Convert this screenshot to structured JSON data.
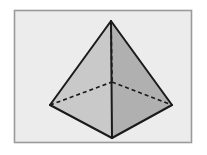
{
  "figure": {
    "title": "Square pyramid wireframe illustration",
    "canvas": {
      "width": 207,
      "height": 155
    },
    "frame": {
      "name": "illustration-border",
      "x": 14.5,
      "y": 10.5,
      "width": 177,
      "height": 132,
      "fill": "#ececec",
      "stroke": "#9a9a9a",
      "stroke_width": 1.6,
      "outer_page_fill": "#ffffff"
    },
    "colors": {
      "background": "#ffffff",
      "panel": "#ececec",
      "base_face": "#8e8e8e",
      "left_face": "#c9c9c9",
      "right_face": "#b0b0b0",
      "edge_visible": "#1a1a1a",
      "edge_hidden": "#1a1a1a",
      "border": "#9a9a9a"
    },
    "stroke": {
      "visible_width": 2.0,
      "hidden_width": 1.7,
      "hidden_dash": "4 3"
    },
    "vertices": {
      "apex": {
        "label": "apex",
        "x": 111,
        "y": 21
      },
      "left": {
        "label": "base-left",
        "x": 50,
        "y": 105
      },
      "right": {
        "label": "base-right",
        "x": 172,
        "y": 105
      },
      "front": {
        "label": "base-front",
        "x": 112,
        "y": 138
      },
      "back": {
        "label": "base-back-hidden",
        "x": 112,
        "y": 82
      }
    },
    "faces": [
      {
        "name": "base-face",
        "points": "50,105 112,82 172,105 112,138",
        "fill": "#8e8e8e",
        "visible": true
      },
      {
        "name": "left-front-face",
        "points": "111,21 50,105 112,138",
        "fill": "#c9c9c9",
        "visible": true
      },
      {
        "name": "right-front-face",
        "points": "111,21 112,138 172,105",
        "fill": "#b0b0b0",
        "visible": true
      }
    ],
    "edges_visible": [
      {
        "name": "edge-apex-left",
        "x1": 111,
        "y1": 21,
        "x2": 50,
        "y2": 105
      },
      {
        "name": "edge-apex-right",
        "x1": 111,
        "y1": 21,
        "x2": 172,
        "y2": 105
      },
      {
        "name": "edge-apex-front",
        "x1": 111,
        "y1": 21,
        "x2": 112,
        "y2": 138
      },
      {
        "name": "edge-base-left-front",
        "x1": 50,
        "y1": 105,
        "x2": 112,
        "y2": 138
      },
      {
        "name": "edge-base-front-right",
        "x1": 112,
        "y1": 138,
        "x2": 172,
        "y2": 105
      }
    ],
    "edges_hidden": [
      {
        "name": "edge-apex-back-hidden",
        "x1": 111,
        "y1": 21,
        "x2": 112,
        "y2": 82
      },
      {
        "name": "edge-base-left-back-hidden",
        "x1": 50,
        "y1": 105,
        "x2": 112,
        "y2": 82
      },
      {
        "name": "edge-base-back-right-hidden",
        "x1": 112,
        "y1": 82,
        "x2": 172,
        "y2": 105
      }
    ]
  }
}
